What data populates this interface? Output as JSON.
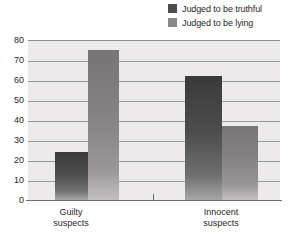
{
  "chart_data": {
    "type": "bar",
    "title": "",
    "xlabel": "",
    "ylabel": "",
    "categories": [
      "Guilty suspects",
      "Innocent suspects"
    ],
    "category_lines": [
      [
        "Guilty",
        "suspects"
      ],
      [
        "Innocent",
        "suspects"
      ]
    ],
    "series": [
      {
        "name": "Judged to be truthful",
        "values": [
          24,
          62
        ],
        "color": "#4d4d4d"
      },
      {
        "name": "Judged to be lying",
        "values": [
          75,
          37
        ],
        "color": "#8a8888"
      }
    ],
    "ylim": [
      0,
      80
    ],
    "yticks": [
      80,
      70,
      60,
      50,
      40,
      30,
      20,
      10,
      0
    ],
    "ytick_labels": [
      "80",
      "70",
      "60",
      "50",
      "40",
      "30",
      "20",
      "10",
      "0"
    ],
    "grid": true,
    "legend_position": "top-right"
  },
  "legend": {
    "items": [
      {
        "label": "Judged to be truthful",
        "color": "#4d4d4d"
      },
      {
        "label": "Judged to be lying",
        "color": "#8a8888"
      }
    ]
  }
}
